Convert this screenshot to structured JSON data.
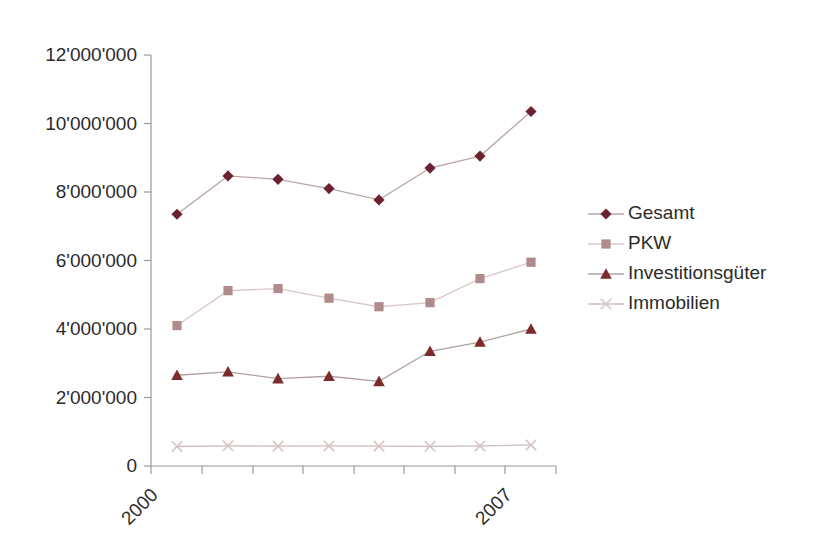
{
  "chart_data": {
    "type": "line",
    "title": "",
    "xlabel": "",
    "ylabel": "",
    "ylim": [
      0,
      12000000
    ],
    "grid": false,
    "legend_position": "right",
    "x": [
      2000,
      2001,
      2002,
      2003,
      2004,
      2005,
      2006,
      2007
    ],
    "categories": [
      "2000",
      "2001",
      "2002",
      "2003",
      "2004",
      "2005",
      "2006",
      "2007"
    ],
    "xtick_labels_visible": [
      "2000",
      "2007"
    ],
    "ytick_labels": [
      "12'000'000",
      "10'000'000",
      "8'000'000",
      "6'000'000",
      "4'000'000",
      "2'000'000",
      "0"
    ],
    "ytick_values": [
      12000000,
      10000000,
      8000000,
      6000000,
      4000000,
      2000000,
      0
    ],
    "series": [
      {
        "name": "Gesamt",
        "marker": "diamond",
        "color": "#6B2230",
        "line_color": "#b9a6a8",
        "values": [
          7350000,
          8470000,
          8370000,
          8100000,
          7770000,
          8700000,
          9050000,
          10350000
        ]
      },
      {
        "name": "PKW",
        "marker": "square",
        "color": "#B08B8B",
        "line_color": "#d8c8c8",
        "values": [
          4100000,
          5120000,
          5180000,
          4900000,
          4650000,
          4770000,
          5470000,
          5950000
        ]
      },
      {
        "name": "Investitionsgüter",
        "marker": "triangle",
        "color": "#7B2B2B",
        "line_color": "#b0a0a0",
        "values": [
          2650000,
          2750000,
          2550000,
          2620000,
          2470000,
          3350000,
          3620000,
          4000000
        ]
      },
      {
        "name": "Immobilien",
        "marker": "x",
        "color": "#d8c4c4",
        "line_color": "#ccbcbc",
        "values": [
          570000,
          590000,
          580000,
          585000,
          580000,
          575000,
          585000,
          615000
        ]
      }
    ]
  },
  "legend": {
    "items": [
      {
        "label": "Gesamt"
      },
      {
        "label": "PKW"
      },
      {
        "label": "Investitionsgüter"
      },
      {
        "label": "Immobilien"
      }
    ]
  }
}
